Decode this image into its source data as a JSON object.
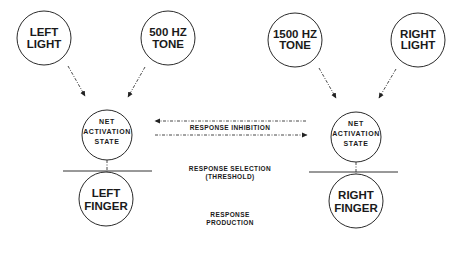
{
  "diagram": {
    "inputs": {
      "left_light": [
        "LEFT",
        "LIGHT"
      ],
      "tone_500": [
        "500 HZ",
        "TONE"
      ],
      "tone_1500": [
        "1500 HZ",
        "TONE"
      ],
      "right_light": [
        "RIGHT",
        "LIGHT"
      ]
    },
    "net_activation": {
      "left": [
        "NET",
        "ACTIVATION",
        "STATE"
      ],
      "right": [
        "NET",
        "ACTIVATION",
        "STATE"
      ]
    },
    "outputs": {
      "left_finger": [
        "LEFT",
        "FINGER"
      ],
      "right_finger": [
        "RIGHT",
        "FINGER"
      ]
    },
    "stage_labels": {
      "inhibition": "RESPONSE  INHIBITION",
      "selection": [
        "RESPONSE  SELECTION",
        "(THRESHOLD)"
      ],
      "production": [
        "RESPONSE",
        "PRODUCTION"
      ]
    }
  }
}
